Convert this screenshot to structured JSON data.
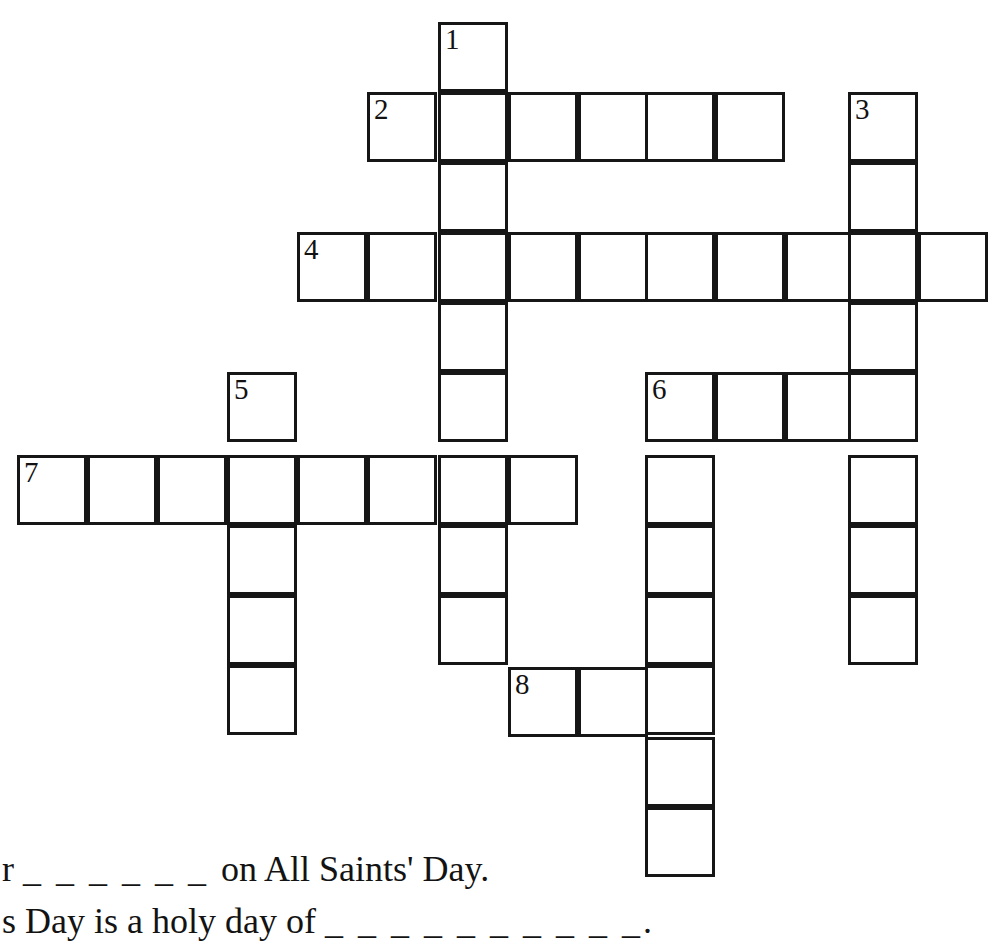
{
  "page": {
    "width": 998,
    "height": 946,
    "background_color": "#ffffff",
    "ink_color": "#161616"
  },
  "grid": {
    "cell_size": 70,
    "border_width": 3,
    "origin_x": 17,
    "origin_y": 22,
    "columns_x": [
      17,
      87,
      157,
      227,
      297,
      367,
      438,
      508,
      578,
      645,
      715,
      785,
      848,
      918,
      988
    ],
    "rows_y": [
      22,
      92,
      162,
      232,
      302,
      372,
      455,
      525,
      595,
      665,
      737,
      807,
      875
    ],
    "cells": [
      {
        "x": 438,
        "y": 22,
        "number": "1",
        "letter": ""
      },
      {
        "x": 367,
        "y": 92,
        "number": "2",
        "letter": ""
      },
      {
        "x": 438,
        "y": 92,
        "number": "",
        "letter": ""
      },
      {
        "x": 508,
        "y": 92,
        "number": "",
        "letter": ""
      },
      {
        "x": 578,
        "y": 92,
        "number": "",
        "letter": ""
      },
      {
        "x": 645,
        "y": 92,
        "number": "",
        "letter": ""
      },
      {
        "x": 715,
        "y": 92,
        "number": "",
        "letter": ""
      },
      {
        "x": 848,
        "y": 92,
        "number": "3",
        "letter": ""
      },
      {
        "x": 438,
        "y": 162,
        "number": "",
        "letter": ""
      },
      {
        "x": 848,
        "y": 162,
        "number": "",
        "letter": ""
      },
      {
        "x": 297,
        "y": 232,
        "number": "4",
        "letter": ""
      },
      {
        "x": 367,
        "y": 232,
        "number": "",
        "letter": ""
      },
      {
        "x": 438,
        "y": 232,
        "number": "",
        "letter": ""
      },
      {
        "x": 508,
        "y": 232,
        "number": "",
        "letter": ""
      },
      {
        "x": 578,
        "y": 232,
        "number": "",
        "letter": ""
      },
      {
        "x": 645,
        "y": 232,
        "number": "",
        "letter": ""
      },
      {
        "x": 715,
        "y": 232,
        "number": "",
        "letter": ""
      },
      {
        "x": 785,
        "y": 232,
        "number": "",
        "letter": ""
      },
      {
        "x": 848,
        "y": 232,
        "number": "",
        "letter": ""
      },
      {
        "x": 918,
        "y": 232,
        "number": "",
        "letter": ""
      },
      {
        "x": 438,
        "y": 302,
        "number": "",
        "letter": ""
      },
      {
        "x": 848,
        "y": 302,
        "number": "",
        "letter": ""
      },
      {
        "x": 227,
        "y": 372,
        "number": "5",
        "letter": ""
      },
      {
        "x": 438,
        "y": 372,
        "number": "",
        "letter": ""
      },
      {
        "x": 645,
        "y": 372,
        "number": "6",
        "letter": ""
      },
      {
        "x": 715,
        "y": 372,
        "number": "",
        "letter": ""
      },
      {
        "x": 785,
        "y": 372,
        "number": "",
        "letter": ""
      },
      {
        "x": 848,
        "y": 372,
        "number": "",
        "letter": ""
      },
      {
        "x": 17,
        "y": 455,
        "number": "7",
        "letter": ""
      },
      {
        "x": 87,
        "y": 455,
        "number": "",
        "letter": ""
      },
      {
        "x": 157,
        "y": 455,
        "number": "",
        "letter": ""
      },
      {
        "x": 227,
        "y": 455,
        "number": "",
        "letter": ""
      },
      {
        "x": 297,
        "y": 455,
        "number": "",
        "letter": ""
      },
      {
        "x": 367,
        "y": 455,
        "number": "",
        "letter": ""
      },
      {
        "x": 438,
        "y": 455,
        "number": "",
        "letter": ""
      },
      {
        "x": 508,
        "y": 455,
        "number": "",
        "letter": ""
      },
      {
        "x": 645,
        "y": 455,
        "number": "",
        "letter": ""
      },
      {
        "x": 848,
        "y": 455,
        "number": "",
        "letter": ""
      },
      {
        "x": 227,
        "y": 525,
        "number": "",
        "letter": ""
      },
      {
        "x": 438,
        "y": 525,
        "number": "",
        "letter": ""
      },
      {
        "x": 645,
        "y": 525,
        "number": "",
        "letter": ""
      },
      {
        "x": 848,
        "y": 525,
        "number": "",
        "letter": ""
      },
      {
        "x": 227,
        "y": 595,
        "number": "",
        "letter": ""
      },
      {
        "x": 438,
        "y": 595,
        "number": "",
        "letter": ""
      },
      {
        "x": 645,
        "y": 595,
        "number": "",
        "letter": ""
      },
      {
        "x": 848,
        "y": 595,
        "number": "",
        "letter": ""
      },
      {
        "x": 227,
        "y": 665,
        "number": "",
        "letter": ""
      },
      {
        "x": 508,
        "y": 667,
        "number": "8",
        "letter": ""
      },
      {
        "x": 578,
        "y": 667,
        "number": "",
        "letter": ""
      },
      {
        "x": 645,
        "y": 665,
        "number": "",
        "letter": ""
      },
      {
        "x": 645,
        "y": 737,
        "number": "",
        "letter": ""
      },
      {
        "x": 645,
        "y": 807,
        "number": "",
        "letter": ""
      }
    ]
  },
  "clues": {
    "lines": [
      {
        "prefix": "r ",
        "blanks": "_ _ _ _ _ _ ",
        "suffix": "on All Saints' Day."
      },
      {
        "prefix": "s Day is a holy day of ",
        "blanks": "_ _ _ _ _ _ _ _ _ _",
        "suffix": "."
      }
    ]
  }
}
